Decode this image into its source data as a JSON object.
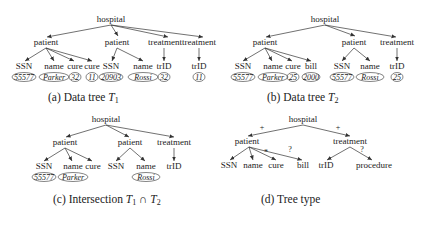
{
  "figure": {
    "panels": [
      {
        "id": "a",
        "caption_prefix": "(a) Data tree ",
        "caption_symbol": "T",
        "caption_sub": "1",
        "root": "hospital",
        "children": [
          {
            "label": "patient",
            "children": [
              {
                "label": "SSN",
                "value": "55577"
              },
              {
                "label": "name",
                "value": "Parker"
              },
              {
                "label": "cure",
                "value": "32"
              },
              {
                "label": "cure",
                "value": "11"
              }
            ]
          },
          {
            "label": "patient",
            "children": [
              {
                "label": "SSN",
                "value": "20903"
              },
              {
                "label": "name",
                "value": "Rossi"
              }
            ]
          },
          {
            "label": "treatment",
            "children": [
              {
                "label": "trID",
                "value": "32"
              }
            ]
          },
          {
            "label": "treatment",
            "children": [
              {
                "label": "trID",
                "value": "11"
              }
            ]
          }
        ]
      },
      {
        "id": "b",
        "caption_prefix": "(b) Data tree ",
        "caption_symbol": "T",
        "caption_sub": "2",
        "root": "hospital",
        "children": [
          {
            "label": "patient",
            "children": [
              {
                "label": "SSN",
                "value": "55577"
              },
              {
                "label": "name",
                "value": "Parker"
              },
              {
                "label": "cure",
                "value": "25"
              },
              {
                "label": "bill",
                "value": "2000"
              }
            ]
          },
          {
            "label": "patient",
            "children": [
              {
                "label": "SSN",
                "value": "55577"
              },
              {
                "label": "name",
                "value": "Rossi"
              }
            ]
          },
          {
            "label": "treatment",
            "children": [
              {
                "label": "trID",
                "value": "25"
              }
            ]
          }
        ]
      },
      {
        "id": "c",
        "caption_prefix": "(c) Intersection ",
        "caption_symbol": "T",
        "caption_sub": "1",
        "caption_op": " ∩ ",
        "caption_symbol2": "T",
        "caption_sub2": "2",
        "root": "hospital",
        "children": [
          {
            "label": "patient",
            "children": [
              {
                "label": "SSN",
                "value": "55577"
              },
              {
                "label": "name",
                "value": "Parker"
              },
              {
                "label": "cure",
                "value": null
              }
            ]
          },
          {
            "label": "patient",
            "children": [
              {
                "label": "SSN",
                "value": null
              },
              {
                "label": "name",
                "value": "Rossi"
              }
            ]
          },
          {
            "label": "treatment",
            "children": [
              {
                "label": "trID",
                "value": null
              }
            ]
          }
        ]
      },
      {
        "id": "d",
        "caption_prefix": "(d) Tree type",
        "root": "hospital",
        "children": [
          {
            "label": "patient",
            "multiplicity": "+",
            "children": [
              {
                "label": "SSN"
              },
              {
                "label": "name"
              },
              {
                "label": "cure",
                "multiplicity": "*"
              },
              {
                "label": "bill",
                "multiplicity": "?"
              }
            ]
          },
          {
            "label": "treatment",
            "multiplicity": "+",
            "children": [
              {
                "label": "trID"
              },
              {
                "label": "procedure",
                "multiplicity": "?"
              }
            ]
          }
        ]
      }
    ]
  }
}
